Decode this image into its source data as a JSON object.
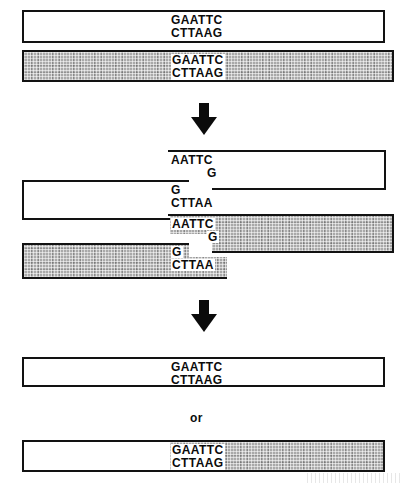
{
  "figure": {
    "colors": {
      "ink": "#121212",
      "shade_fill": "#a9a9a9",
      "background": "#ffffff"
    },
    "stages": [
      {
        "id": "stage-1-intact-duplexes",
        "caption": "Two intact DNA duplexes each carrying an EcoRI recognition site",
        "molecules": [
          {
            "id": "molecule-white-intact",
            "style": "plain",
            "top_strand": "GAATTC",
            "bottom_strand": "CTTAAG"
          },
          {
            "id": "molecule-shaded-intact",
            "style": "shaded",
            "top_strand": "GAATTC",
            "bottom_strand": "CTTAAG"
          }
        ]
      },
      {
        "id": "stage-2-cut-fragments",
        "caption": "Staggered cuts leave complementary single-stranded sticky ends",
        "molecules": [
          {
            "id": "fragment-white-right",
            "style": "plain",
            "top_strand": "AATTC",
            "bottom_strand": "G"
          },
          {
            "id": "fragment-white-left",
            "style": "plain",
            "top_strand": "G",
            "bottom_strand": "CTTAA"
          },
          {
            "id": "fragment-shaded-right",
            "style": "shaded",
            "top_strand": "AATTC",
            "bottom_strand": "G"
          },
          {
            "id": "fragment-shaded-left",
            "style": "shaded",
            "top_strand": "G",
            "bottom_strand": "CTTAA"
          }
        ]
      },
      {
        "id": "stage-3-ligated-products",
        "caption": "Sticky ends anneal and are sealed, regenerating the EcoRI site",
        "alternative_label": "or",
        "molecules": [
          {
            "id": "product-original-rejoin",
            "style": "plain",
            "top_strand": "GAATTC",
            "bottom_strand": "CTTAAG"
          },
          {
            "id": "product-recombinant",
            "style": "hybrid",
            "top_strand": "GAATTC",
            "bottom_strand": "CTTAAG"
          }
        ]
      }
    ],
    "arrows": [
      {
        "id": "arrow-digest",
        "direction": "down"
      },
      {
        "id": "arrow-ligate",
        "direction": "down"
      }
    ]
  }
}
